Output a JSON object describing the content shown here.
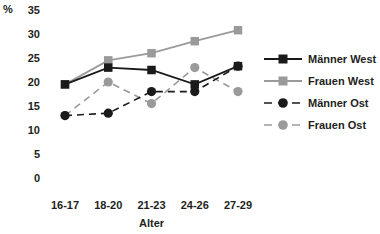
{
  "chart_data": {
    "type": "line",
    "title": "",
    "subtitle": "",
    "unit_label": "%",
    "xlabel": "Alter",
    "ylabel": "",
    "categories": [
      "16-17",
      "18-20",
      "21-23",
      "24-26",
      "27-29"
    ],
    "ylim": [
      0,
      35
    ],
    "yticks": [
      0,
      5,
      10,
      15,
      20,
      25,
      30,
      35
    ],
    "ytick_labels": [
      "0",
      "5",
      "10",
      "15",
      "20",
      "25",
      "30",
      "35"
    ],
    "grid": false,
    "legend_position": "right",
    "series": [
      {
        "name": "Männer West",
        "values": [
          19.5,
          23.0,
          22.5,
          19.5,
          23.3
        ],
        "color": "#1a1a1a",
        "marker": "square",
        "linestyle": "solid"
      },
      {
        "name": "Frauen West",
        "values": [
          19.5,
          24.5,
          26.0,
          28.5,
          30.8
        ],
        "color": "#9a9a9a",
        "marker": "square",
        "linestyle": "solid"
      },
      {
        "name": "Männer Ost",
        "values": [
          13.0,
          13.5,
          18.0,
          18.0,
          23.3
        ],
        "color": "#1a1a1a",
        "marker": "circle",
        "linestyle": "dashed"
      },
      {
        "name": "Frauen Ost",
        "values": [
          13.0,
          20.0,
          15.5,
          23.0,
          18.0
        ],
        "color": "#9a9a9a",
        "marker": "circle",
        "linestyle": "dashed"
      }
    ]
  },
  "legend": {
    "items": [
      {
        "label": "Männer West"
      },
      {
        "label": "Frauen West"
      },
      {
        "label": "Männer Ost"
      },
      {
        "label": "Frauen Ost"
      }
    ]
  },
  "axes": {
    "unit": "%",
    "x_title": "Alter"
  }
}
